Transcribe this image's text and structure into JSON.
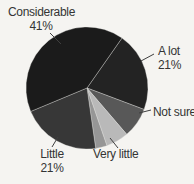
{
  "chart_data": {
    "type": "pie",
    "start_angle_deg_cw_from_north": 35,
    "unit": "%",
    "legend": "callout-labels",
    "background_color": "#f5f4f1",
    "segments": [
      {
        "id": "a-lot",
        "label": "A lot",
        "pct_label": "21%",
        "value": 21,
        "color": "#232323"
      },
      {
        "id": "not-sure",
        "label": "Not sure",
        "pct_label": "",
        "value": 8,
        "color": "#585858"
      },
      {
        "id": "very-little",
        "label": "Very little",
        "pct_label": "",
        "value": 6,
        "color": "#b9b9b9"
      },
      {
        "id": "unlabeled-small-segment",
        "label": "",
        "pct_label": "",
        "value": 3,
        "color": "#969696"
      },
      {
        "id": "little",
        "label": "Little",
        "pct_label": "21%",
        "value": 21,
        "color": "#373737"
      },
      {
        "id": "considerable",
        "label": "Considerable",
        "pct_label": "41%",
        "value": 41,
        "color": "#1b1b1b"
      }
    ]
  }
}
